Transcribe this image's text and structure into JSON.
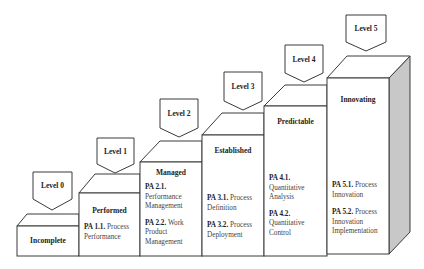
{
  "diagram": {
    "type": "capability-maturity-staircase",
    "colors": {
      "stroke": "#3a3a3a",
      "face": "#ffffff",
      "side_shade": "#c8c8c8",
      "text": "#222222"
    },
    "levels": [
      {
        "label": "Level 0",
        "stage": "Incomplete",
        "process_attributes": []
      },
      {
        "label": "Level 1",
        "stage": "Performed",
        "process_attributes": [
          {
            "id": "PA 1.1.",
            "name": "Process Performance"
          }
        ]
      },
      {
        "label": "Level 2",
        "stage": "Managed",
        "process_attributes": [
          {
            "id": "PA 2.1.",
            "name": "Performance Management"
          },
          {
            "id": "PA 2.2.",
            "name": "Work Product Management"
          }
        ]
      },
      {
        "label": "Level 3",
        "stage": "Established",
        "process_attributes": [
          {
            "id": "PA 3.1.",
            "name": "Process Definition"
          },
          {
            "id": "PA 3.2.",
            "name": "Process Deployment"
          }
        ]
      },
      {
        "label": "Level 4",
        "stage": "Predictable",
        "process_attributes": [
          {
            "id": "PA 4.1.",
            "name": "Quantitative Analysis"
          },
          {
            "id": "PA 4.2.",
            "name": "Quantitative Control"
          }
        ]
      },
      {
        "label": "Level 5",
        "stage": "Innovating",
        "process_attributes": [
          {
            "id": "PA 5.1.",
            "name": "Process Innovation"
          },
          {
            "id": "PA 5.2.",
            "name": "Process Innovation Implementation"
          }
        ]
      }
    ]
  }
}
